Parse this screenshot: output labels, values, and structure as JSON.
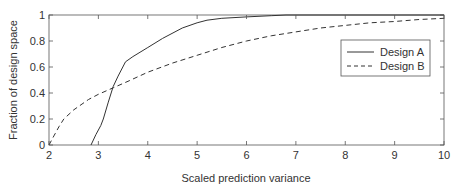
{
  "chart_data": {
    "type": "line",
    "title": "",
    "xlabel": "Scaled prediction variance",
    "ylabel": "Fraction of design space",
    "xlim": [
      2,
      10
    ],
    "ylim": [
      0,
      1
    ],
    "xticks": [
      2,
      3,
      4,
      5,
      6,
      7,
      8,
      9,
      10
    ],
    "yticks": [
      0,
      0.2,
      0.4,
      0.6,
      0.8,
      1
    ],
    "xtick_labels": [
      "2",
      "3",
      "4",
      "5",
      "6",
      "7",
      "8",
      "9",
      "10"
    ],
    "ytick_labels": [
      "0",
      "0.2",
      "0.4",
      "0.6",
      "0.8",
      "1"
    ],
    "grid": false,
    "legend_position": "upper right (inside, below top)",
    "series": [
      {
        "name": "Design A",
        "style": "solid",
        "color": "#333333",
        "x": [
          2.85,
          2.95,
          3.05,
          3.1,
          3.2,
          3.3,
          3.4,
          3.55,
          3.7,
          4.0,
          4.3,
          4.7,
          5.0,
          5.2,
          5.5,
          6.0,
          6.5,
          6.8,
          10.0
        ],
        "y": [
          0.0,
          0.08,
          0.15,
          0.2,
          0.33,
          0.45,
          0.53,
          0.64,
          0.68,
          0.75,
          0.82,
          0.9,
          0.94,
          0.96,
          0.975,
          0.985,
          0.995,
          1.0,
          1.0
        ]
      },
      {
        "name": "Design B",
        "style": "dashed",
        "color": "#333333",
        "x": [
          2.0,
          2.1,
          2.2,
          2.3,
          2.5,
          2.8,
          3.0,
          3.3,
          3.6,
          4.0,
          4.5,
          5.0,
          5.5,
          6.0,
          6.5,
          7.0,
          7.5,
          8.0,
          8.5,
          9.0,
          9.5,
          10.0
        ],
        "y": [
          0.0,
          0.07,
          0.14,
          0.2,
          0.27,
          0.35,
          0.39,
          0.44,
          0.49,
          0.56,
          0.63,
          0.69,
          0.75,
          0.8,
          0.84,
          0.87,
          0.9,
          0.92,
          0.94,
          0.95,
          0.965,
          0.975
        ]
      }
    ]
  },
  "legend": {
    "items": [
      {
        "label": "Design A",
        "style": "solid"
      },
      {
        "label": "Design B",
        "style": "dashed"
      }
    ]
  },
  "colors": {
    "axis": "#555555",
    "line": "#333333",
    "text": "#333333",
    "background": "#ffffff"
  }
}
